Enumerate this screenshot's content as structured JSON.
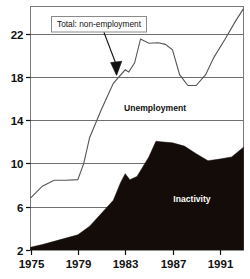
{
  "chart_data": {
    "type": "area",
    "title": "",
    "subtitle": "",
    "xlabel": "",
    "ylabel": "",
    "xlim": [
      1975,
      1993
    ],
    "ylim": [
      2,
      24.5
    ],
    "xticks": [
      1975,
      1979,
      1983,
      1987,
      1991
    ],
    "xtick_labels": [
      "1975",
      "1979",
      "1983",
      "1987",
      "1991"
    ],
    "yticks": [
      2,
      6,
      10,
      14,
      18,
      22
    ],
    "ytick_labels": [
      "2",
      "6",
      "10",
      "14",
      "18",
      "22"
    ],
    "grid": "horizontal",
    "legend": "inline-labels",
    "annotations": [
      {
        "name": "total-callout",
        "text": "Total: non-employment",
        "box": true,
        "points_to_year": 1982.5,
        "points_to_value": 18.6
      }
    ],
    "series": [
      {
        "name": "Inactivity",
        "label": "Inactivity",
        "type": "area",
        "fill": "#140c08",
        "x": [
          1975,
          1976,
          1977,
          1978,
          1979,
          1980,
          1981,
          1982,
          1982.6,
          1983,
          1983.4,
          1984,
          1985,
          1985.6,
          1986,
          1987,
          1988,
          1989,
          1990,
          1991,
          1992,
          1993
        ],
        "values": [
          2.25,
          2.5,
          2.8,
          3.1,
          3.4,
          4.2,
          5.4,
          6.6,
          8.2,
          9.05,
          8.5,
          8.8,
          10.6,
          12.05,
          12.0,
          11.9,
          11.6,
          10.9,
          10.25,
          10.4,
          10.6,
          11.5
        ]
      },
      {
        "name": "Total: non-employment",
        "label": "Unemployment",
        "type": "line",
        "stroke": "#555555",
        "x": [
          1975,
          1976,
          1977,
          1978,
          1979,
          1979.5,
          1980,
          1981,
          1982,
          1983,
          1983.3,
          1983.8,
          1984.3,
          1985,
          1985.8,
          1986.4,
          1987,
          1987.6,
          1988.3,
          1989,
          1989.8,
          1990.5,
          1991.4,
          1992.3,
          1993
        ],
        "values": [
          6.8,
          7.9,
          8.45,
          8.45,
          8.5,
          10.0,
          12.4,
          15.0,
          17.4,
          18.65,
          18.45,
          19.3,
          21.5,
          21.1,
          21.15,
          21.0,
          20.5,
          18.2,
          17.2,
          17.2,
          18.2,
          19.8,
          21.4,
          23.1,
          24.3
        ]
      }
    ],
    "series_labels": [
      {
        "name": "unemployment-label",
        "text": "Unemployment",
        "on_dark": false
      },
      {
        "name": "inactivity-label",
        "text": "Inactivity",
        "on_dark": true
      }
    ]
  }
}
